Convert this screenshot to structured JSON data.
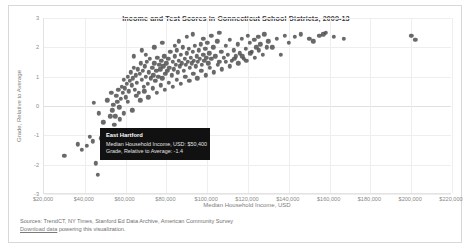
{
  "card": {
    "title": "Income and Test Scores in Connecticut School Districts, 2009-13"
  },
  "axes": {
    "xlabel": "Median Household Income, USD",
    "ylabel": "Grade, Relative to Average",
    "xticks": [
      "$20,000",
      "$40,000",
      "$60,000",
      "$80,000",
      "$100,000",
      "$120,000",
      "$140,000",
      "$160,000",
      "$180,000",
      "$200,000",
      "$220,000"
    ],
    "yticks": [
      "3",
      "2",
      "1",
      "0",
      "-1",
      "-2",
      "-3"
    ]
  },
  "tooltip": {
    "title": "East Hartford",
    "row1": "Median Household Income, USD: $50,400",
    "row2": "Grade, Relative to Average: -1.4"
  },
  "footer": {
    "sources": "Sources: TrendCT, NY Times, Stanford Ed Data Archive, American Community Survey",
    "link": "Download data",
    "link_suffix": " powering this visualization."
  },
  "colors": {
    "point": "#505050",
    "tooltip_bg": "#111111",
    "grid": "#eeeeee",
    "text": "#7d7d7d"
  },
  "chart_data": {
    "type": "scatter",
    "title": "Income and Test Scores in Connecticut School Districts, 2009-13",
    "xlabel": "Median Household Income, USD",
    "ylabel": "Grade, Relative to Average",
    "xlim": [
      20000,
      220000
    ],
    "ylim": [
      -3,
      3
    ],
    "grid": true,
    "legend": null,
    "highlight": {
      "name": "East Hartford",
      "x": 50400,
      "y": -1.4
    },
    "points": [
      [
        30000,
        -1.7
      ],
      [
        36500,
        -1.3
      ],
      [
        38500,
        -1.5
      ],
      [
        41000,
        -1.35
      ],
      [
        42500,
        -1.05
      ],
      [
        44000,
        -1.2
      ],
      [
        45500,
        -1.95
      ],
      [
        46500,
        -2.35
      ],
      [
        48000,
        -1.1
      ],
      [
        49000,
        -0.55
      ],
      [
        50400,
        -1.4
      ],
      [
        51500,
        -0.95
      ],
      [
        52500,
        -0.35
      ],
      [
        53500,
        -0.15
      ],
      [
        54000,
        0.05
      ],
      [
        54500,
        -0.65
      ],
      [
        55500,
        0.35
      ],
      [
        56000,
        0.15
      ],
      [
        56500,
        0.55
      ],
      [
        57000,
        -0.05
      ],
      [
        57500,
        0.25
      ],
      [
        58000,
        0.65
      ],
      [
        58500,
        0.45
      ],
      [
        59000,
        0.9
      ],
      [
        59500,
        0.6
      ],
      [
        60000,
        0.3
      ],
      [
        60500,
        0.75
      ],
      [
        61000,
        1.0
      ],
      [
        61500,
        0.5
      ],
      [
        62000,
        0.85
      ],
      [
        62500,
        1.15
      ],
      [
        63000,
        0.7
      ],
      [
        63500,
        0.95
      ],
      [
        64000,
        1.3
      ],
      [
        64500,
        0.55
      ],
      [
        65000,
        1.05
      ],
      [
        65500,
        0.8
      ],
      [
        66000,
        1.25
      ],
      [
        66500,
        0.45
      ],
      [
        67000,
        1.1
      ],
      [
        67500,
        1.45
      ],
      [
        68000,
        0.9
      ],
      [
        68500,
        1.2
      ],
      [
        69000,
        0.65
      ],
      [
        69500,
        1.35
      ],
      [
        70000,
        1.0
      ],
      [
        70500,
        1.5
      ],
      [
        71000,
        0.75
      ],
      [
        71500,
        1.15
      ],
      [
        72000,
        1.6
      ],
      [
        72500,
        0.95
      ],
      [
        73000,
        1.3
      ],
      [
        73500,
        1.05
      ],
      [
        74000,
        1.45
      ],
      [
        74500,
        0.85
      ],
      [
        75000,
        1.2
      ],
      [
        75500,
        1.65
      ],
      [
        76000,
        1.0
      ],
      [
        76500,
        1.4
      ],
      [
        77000,
        1.25
      ],
      [
        77500,
        1.55
      ],
      [
        78000,
        0.95
      ],
      [
        78500,
        1.35
      ],
      [
        79000,
        1.7
      ],
      [
        79500,
        1.1
      ],
      [
        80000,
        1.45
      ],
      [
        80500,
        1.2
      ],
      [
        81000,
        1.6
      ],
      [
        81500,
        1.3
      ],
      [
        82000,
        1.85
      ],
      [
        82500,
        1.05
      ],
      [
        83000,
        1.5
      ],
      [
        83500,
        1.25
      ],
      [
        84000,
        1.7
      ],
      [
        84500,
        1.4
      ],
      [
        85000,
        1.9
      ],
      [
        85500,
        1.15
      ],
      [
        86000,
        1.55
      ],
      [
        86500,
        1.35
      ],
      [
        87000,
        1.75
      ],
      [
        87500,
        1.45
      ],
      [
        88000,
        2.0
      ],
      [
        88500,
        1.2
      ],
      [
        89000,
        1.6
      ],
      [
        89500,
        1.4
      ],
      [
        90000,
        1.8
      ],
      [
        90500,
        1.5
      ],
      [
        91000,
        1.95
      ],
      [
        91500,
        1.3
      ],
      [
        92000,
        1.65
      ],
      [
        92500,
        1.45
      ],
      [
        93000,
        1.85
      ],
      [
        93500,
        1.55
      ],
      [
        94000,
        2.05
      ],
      [
        94500,
        1.35
      ],
      [
        95000,
        1.7
      ],
      [
        95500,
        1.5
      ],
      [
        96000,
        1.9
      ],
      [
        96500,
        1.6
      ],
      [
        97000,
        2.1
      ],
      [
        97500,
        1.4
      ],
      [
        98000,
        1.75
      ],
      [
        98500,
        1.55
      ],
      [
        99000,
        1.95
      ],
      [
        99500,
        1.65
      ],
      [
        100000,
        2.15
      ],
      [
        100500,
        1.45
      ],
      [
        101000,
        1.8
      ],
      [
        102000,
        1.6
      ],
      [
        103000,
        2.0
      ],
      [
        104000,
        1.7
      ],
      [
        105000,
        2.2
      ],
      [
        106000,
        1.5
      ],
      [
        107000,
        1.85
      ],
      [
        108000,
        1.65
      ],
      [
        109000,
        2.05
      ],
      [
        110000,
        1.75
      ],
      [
        111000,
        2.25
      ],
      [
        112000,
        1.55
      ],
      [
        113000,
        1.9
      ],
      [
        114000,
        1.7
      ],
      [
        115000,
        2.1
      ],
      [
        116000,
        1.8
      ],
      [
        117000,
        2.3
      ],
      [
        118000,
        1.6
      ],
      [
        119000,
        1.95
      ],
      [
        120000,
        2.4
      ],
      [
        121000,
        2.15
      ],
      [
        122000,
        1.85
      ],
      [
        123000,
        2.25
      ],
      [
        124000,
        2.0
      ],
      [
        125000,
        2.35
      ],
      [
        126000,
        2.1
      ],
      [
        128000,
        2.45
      ],
      [
        130000,
        2.2
      ],
      [
        132000,
        2.0
      ],
      [
        134000,
        2.3
      ],
      [
        136000,
        1.75
      ],
      [
        138000,
        2.4
      ],
      [
        140000,
        2.15
      ],
      [
        143000,
        2.35
      ],
      [
        146000,
        2.45
      ],
      [
        150000,
        2.3
      ],
      [
        152000,
        2.2
      ],
      [
        155000,
        2.4
      ],
      [
        157000,
        2.45
      ],
      [
        158000,
        2.5
      ],
      [
        162000,
        2.35
      ],
      [
        167000,
        2.3
      ],
      [
        200000,
        2.4
      ],
      [
        202000,
        2.25
      ],
      [
        44500,
        0.1
      ],
      [
        47000,
        -0.25
      ],
      [
        51000,
        0.2
      ],
      [
        53000,
        0.45
      ],
      [
        55000,
        -0.35
      ],
      [
        57200,
        -0.45
      ],
      [
        59200,
        -0.25
      ],
      [
        61200,
        0.15
      ],
      [
        63200,
        -0.15
      ],
      [
        65200,
        0.35
      ],
      [
        67200,
        0.2
      ],
      [
        69200,
        0.5
      ],
      [
        71200,
        0.3
      ],
      [
        73200,
        0.6
      ],
      [
        75200,
        0.45
      ],
      [
        77200,
        0.7
      ],
      [
        79200,
        0.55
      ],
      [
        81200,
        0.8
      ],
      [
        83200,
        0.65
      ],
      [
        85200,
        0.9
      ],
      [
        87200,
        0.75
      ],
      [
        89200,
        1.0
      ],
      [
        91200,
        0.85
      ],
      [
        93200,
        1.1
      ],
      [
        95200,
        0.95
      ],
      [
        97200,
        1.2
      ],
      [
        99200,
        1.05
      ],
      [
        101200,
        1.3
      ],
      [
        103200,
        1.15
      ],
      [
        105200,
        1.4
      ],
      [
        107200,
        1.25
      ],
      [
        109200,
        1.5
      ],
      [
        111200,
        1.35
      ],
      [
        113200,
        1.6
      ],
      [
        115200,
        1.45
      ],
      [
        117200,
        1.7
      ],
      [
        119200,
        1.55
      ],
      [
        121200,
        1.8
      ],
      [
        123200,
        1.65
      ],
      [
        125200,
        1.9
      ],
      [
        127200,
        1.75
      ],
      [
        129200,
        2.0
      ],
      [
        86000,
        2.2
      ],
      [
        90000,
        2.35
      ],
      [
        93000,
        2.45
      ],
      [
        98000,
        2.3
      ],
      [
        102000,
        2.4
      ],
      [
        106000,
        2.5
      ],
      [
        84000,
        2.05
      ],
      [
        68000,
        1.9
      ],
      [
        74000,
        2.0
      ],
      [
        78000,
        2.15
      ],
      [
        64000,
        1.7
      ],
      [
        70000,
        1.75
      ]
    ]
  }
}
